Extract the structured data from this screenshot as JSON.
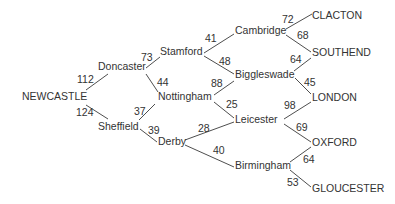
{
  "diagram": {
    "type": "weighted-route-network",
    "colors": {
      "text": "#333333",
      "line": "#3a3a3a",
      "background": "#ffffff"
    },
    "nodes": {
      "newcastle": {
        "label": "NEWCASTLE",
        "x": 22,
        "y": 100
      },
      "doncaster": {
        "label": "Doncaster",
        "x": 98,
        "y": 70
      },
      "sheffield": {
        "label": "Sheffield",
        "x": 98,
        "y": 130
      },
      "stamford": {
        "label": "Stamford",
        "x": 160,
        "y": 55
      },
      "nottingham": {
        "label": "Nottingham",
        "x": 158,
        "y": 100
      },
      "derby": {
        "label": "Derby",
        "x": 158,
        "y": 145
      },
      "cambridge": {
        "label": "Cambridge",
        "x": 235,
        "y": 34
      },
      "biggleswade": {
        "label": "Biggleswade",
        "x": 235,
        "y": 78
      },
      "leicester": {
        "label": "Leicester",
        "x": 235,
        "y": 123
      },
      "birmingham": {
        "label": "Birmingham",
        "x": 235,
        "y": 169
      },
      "clacton": {
        "label": "CLACTON",
        "x": 312,
        "y": 19
      },
      "southend": {
        "label": "SOUTHEND",
        "x": 312,
        "y": 56
      },
      "london": {
        "label": "LONDON",
        "x": 312,
        "y": 101
      },
      "oxford": {
        "label": "OXFORD",
        "x": 312,
        "y": 146
      },
      "gloucester": {
        "label": "GLOUCESTER",
        "x": 312,
        "y": 192
      }
    },
    "edges": [
      {
        "from": "NEWCASTLE",
        "to": "Doncaster",
        "weight": "112",
        "line": [
          86,
          90,
          108,
          74
        ],
        "label_pos": [
          77,
          83
        ]
      },
      {
        "from": "NEWCASTLE",
        "to": "Sheffield",
        "weight": "124",
        "line": [
          86,
          105,
          108,
          119
        ],
        "label_pos": [
          76,
          116
        ]
      },
      {
        "from": "Doncaster",
        "to": "Stamford",
        "weight": "73",
        "line": [
          146,
          68,
          160,
          57
        ],
        "label_pos": [
          141,
          61
        ]
      },
      {
        "from": "Doncaster",
        "to": "Nottingham",
        "weight": "44",
        "line": [
          146,
          74,
          158,
          92
        ],
        "label_pos": [
          157,
          86
        ]
      },
      {
        "from": "Sheffield",
        "to": "Nottingham",
        "weight": "37",
        "line": [
          139,
          120,
          155,
          104
        ],
        "label_pos": [
          134,
          115
        ]
      },
      {
        "from": "Sheffield",
        "to": "Derby",
        "weight": "39",
        "line": [
          140,
          129,
          157,
          142
        ],
        "label_pos": [
          148,
          134
        ]
      },
      {
        "from": "Stamford",
        "to": "Cambridge",
        "weight": "41",
        "line": [
          204,
          53,
          234,
          34
        ],
        "label_pos": [
          205,
          42
        ]
      },
      {
        "from": "Stamford",
        "to": "Biggleswade",
        "weight": "48",
        "line": [
          204,
          56,
          234,
          74
        ],
        "label_pos": [
          219,
          65
        ]
      },
      {
        "from": "Nottingham",
        "to": "Biggleswade",
        "weight": "88",
        "line": [
          214,
          95,
          234,
          81
        ],
        "label_pos": [
          211,
          87
        ]
      },
      {
        "from": "Nottingham",
        "to": "Leicester",
        "weight": "25",
        "line": [
          214,
          102,
          234,
          118
        ],
        "label_pos": [
          226,
          108
        ]
      },
      {
        "from": "Derby",
        "to": "Leicester",
        "weight": "28",
        "line": [
          185,
          140,
          234,
          122
        ],
        "label_pos": [
          198,
          132
        ]
      },
      {
        "from": "Derby",
        "to": "Birmingham",
        "weight": "40",
        "line": [
          185,
          145,
          234,
          167
        ],
        "label_pos": [
          213,
          154
        ]
      },
      {
        "from": "Cambridge",
        "to": "CLACTON",
        "weight": "72",
        "line": [
          286,
          29,
          312,
          14
        ],
        "label_pos": [
          282,
          23
        ]
      },
      {
        "from": "Cambridge",
        "to": "SOUTHEND",
        "weight": "68",
        "line": [
          286,
          35,
          311,
          52
        ],
        "label_pos": [
          297,
          39
        ]
      },
      {
        "from": "Biggleswade",
        "to": "SOUTHEND",
        "weight": "64",
        "line": [
          294,
          71,
          311,
          58
        ],
        "label_pos": [
          290,
          63
        ]
      },
      {
        "from": "Biggleswade",
        "to": "LONDON",
        "weight": "45",
        "line": [
          295,
          78,
          311,
          94
        ],
        "label_pos": [
          304,
          86
        ]
      },
      {
        "from": "Leicester",
        "to": "LONDON",
        "weight": "98",
        "line": [
          284,
          119,
          311,
          102
        ],
        "label_pos": [
          284,
          109
        ]
      },
      {
        "from": "Leicester",
        "to": "OXFORD",
        "weight": "69",
        "line": [
          284,
          124,
          311,
          142
        ],
        "label_pos": [
          296,
          131
        ]
      },
      {
        "from": "Birmingham",
        "to": "OXFORD",
        "weight": "64",
        "line": [
          290,
          162,
          311,
          147
        ],
        "label_pos": [
          303,
          163
        ]
      },
      {
        "from": "Birmingham",
        "to": "GLOUCESTER",
        "weight": "53",
        "line": [
          290,
          170,
          311,
          187
        ],
        "label_pos": [
          287,
          186
        ]
      }
    ]
  }
}
